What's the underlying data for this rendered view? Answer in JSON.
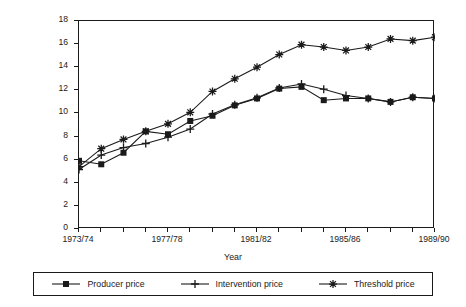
{
  "chart_data": {
    "type": "line",
    "title": "",
    "xlabel": "Year",
    "ylabel": "£/100 kg",
    "ylim": [
      0,
      18
    ],
    "ytick_step": 2,
    "yticks": [
      0,
      2,
      4,
      6,
      8,
      10,
      12,
      14,
      16,
      18
    ],
    "grid": false,
    "legend_position": "bottom",
    "x": [
      "1973/74",
      "1974/75",
      "1975/76",
      "1976/77",
      "1977/78",
      "1978/79",
      "1979/80",
      "1980/81",
      "1981/82",
      "1982/83",
      "1983/84",
      "1984/85",
      "1985/86",
      "1986/87",
      "1987/88",
      "1988/89",
      "1989/90"
    ],
    "xtick_labels_shown": [
      "1973/74",
      "1977/78",
      "1981/82",
      "1985/86",
      "1989/90"
    ],
    "series": [
      {
        "name": "Producer price",
        "marker": "filled-square",
        "values": [
          5.9,
          5.6,
          6.6,
          8.45,
          8.2,
          9.35,
          9.8,
          10.7,
          11.3,
          12.15,
          12.3,
          11.15,
          11.3,
          11.3,
          11.0,
          11.4,
          11.3
        ]
      },
      {
        "name": "Intervention price",
        "marker": "plus",
        "values": [
          5.15,
          6.4,
          7.05,
          7.4,
          7.95,
          8.65,
          9.95,
          10.75,
          11.35,
          12.2,
          12.55,
          12.1,
          11.55,
          11.3,
          11.0,
          11.4,
          11.3
        ]
      },
      {
        "name": "Threshold price",
        "marker": "asterisk",
        "values": [
          5.4,
          6.95,
          7.75,
          8.45,
          9.1,
          10.1,
          11.9,
          13.0,
          14.0,
          15.1,
          15.95,
          15.75,
          15.45,
          15.75,
          16.45,
          16.3,
          16.6
        ]
      }
    ]
  },
  "axis": {
    "y_title": "£/100 kg",
    "x_title": "Year"
  },
  "legend": {
    "entries": [
      {
        "label": "Producer price",
        "marker": "filled-square"
      },
      {
        "label": "Intervention price",
        "marker": "plus"
      },
      {
        "label": "Threshold price",
        "marker": "asterisk"
      }
    ]
  },
  "colors": {
    "ink": "#1a1a1a",
    "background": "#ffffff"
  }
}
